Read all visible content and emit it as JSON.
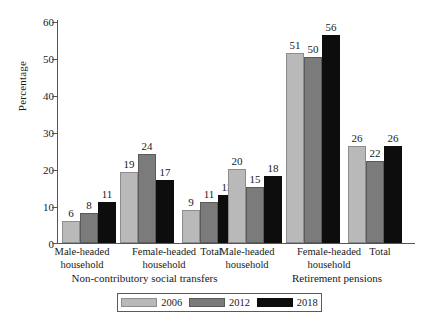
{
  "chart_data": {
    "type": "bar",
    "title": "",
    "xlabel": "",
    "ylabel": "Percentage",
    "ylim": [
      0,
      60
    ],
    "yticks": [
      0,
      10,
      20,
      30,
      40,
      50,
      60
    ],
    "grid": false,
    "legend_position": "bottom",
    "categories": [
      "Male-headed household",
      "Female-headed household",
      "Total",
      "Male-headed household",
      "Female-headed household",
      "Total"
    ],
    "group_labels": [
      "Non-contributory social transfers",
      "Retirement pensions"
    ],
    "groups": [
      {
        "label": "Non-contributory social transfers",
        "categories": [
          "Male-headed household",
          "Female-headed household",
          "Total"
        ],
        "category_lines": [
          [
            "Male-headed",
            "household"
          ],
          [
            "Female-headed",
            "household"
          ],
          [
            "Total",
            ""
          ]
        ],
        "values": {
          "2006": [
            6,
            19,
            9
          ],
          "2012": [
            8,
            24,
            11
          ],
          "2018": [
            11,
            17,
            13
          ]
        }
      },
      {
        "label": "Retirement pensions",
        "categories": [
          "Male-headed household",
          "Female-headed household",
          "Total"
        ],
        "category_lines": [
          [
            "Male-headed",
            "household"
          ],
          [
            "Female-headed",
            "household"
          ],
          [
            "Total",
            ""
          ]
        ],
        "values": {
          "2006": [
            20,
            51,
            26
          ],
          "2012": [
            15,
            50,
            22
          ],
          "2018": [
            18,
            56,
            26
          ]
        }
      }
    ],
    "series": [
      {
        "name": "2006",
        "color": "#b9b9b9",
        "values": [
          6,
          19,
          9,
          20,
          51,
          26
        ]
      },
      {
        "name": "2012",
        "color": "#7b7b7b",
        "values": [
          8,
          24,
          11,
          15,
          50,
          22
        ]
      },
      {
        "name": "2018",
        "color": "#0d0d0d",
        "values": [
          11,
          17,
          13,
          18,
          56,
          26
        ]
      }
    ]
  },
  "legend": {
    "items": [
      {
        "label": "2006",
        "color": "#b9b9b9"
      },
      {
        "label": "2012",
        "color": "#7b7b7b"
      },
      {
        "label": "2018",
        "color": "#0d0d0d"
      }
    ]
  },
  "axis": {
    "y_label": "Percentage",
    "y_ticks": [
      "60",
      "50",
      "40",
      "30",
      "20",
      "10",
      "0"
    ]
  }
}
